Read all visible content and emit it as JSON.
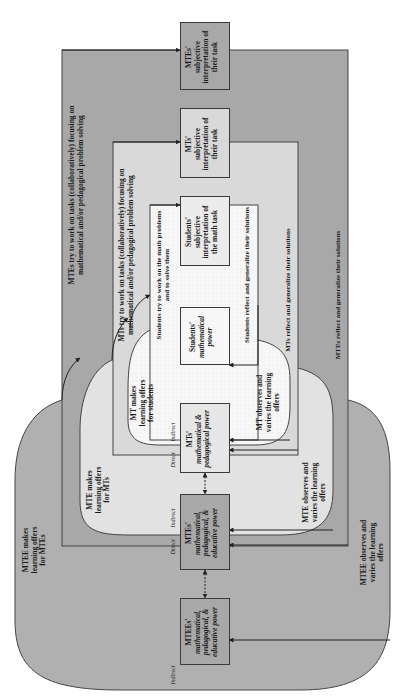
{
  "colors": {
    "outer_level": "#a8a8a8",
    "middle_level": "#d9d9d9",
    "inner_level": "#f5f5f5",
    "outer_blob": "#b0b0b0",
    "middle_blob": "#e2e2e2",
    "inner_blob": "#fafafa",
    "border": "#3a3a3a"
  },
  "orientation": "rotated 90 degrees counter-clockwise (text reads bottom-to-top)",
  "boxes": {
    "mtees_power": {
      "name": "MTEEs'",
      "desc": "mathematical, pedagogical, & educative power"
    },
    "mtes_power": {
      "name": "MTEs'",
      "desc": "mathematical, pedagogical, & educative power"
    },
    "mts_power": {
      "name": "MTs'",
      "desc": "mathematical & pedagogical power"
    },
    "students_power": {
      "name": "Students'",
      "desc": "mathematical power"
    },
    "students_subjective": {
      "line1": "Students'",
      "line2": "subjective",
      "line3": "interpretation of",
      "line4": "the math task"
    },
    "mts_subjective": {
      "line1": "MTs'",
      "line2": "subjective",
      "line3": "interpretation of",
      "line4": "their task"
    },
    "mtes_subjective": {
      "line1": "MTEs'",
      "line2": "subjective",
      "line3": "interpretation of",
      "line4": "their task"
    }
  },
  "flows": {
    "mtes_work_1": "MTEs try to work on tasks (collaboratively) focusing on",
    "mtes_work_2": "mathematical and/or pedagogical problem solving",
    "mts_work_1": "MTs try to work on tasks (collaboratively) focusing on",
    "mts_work_2": "mathematical and/or pedagogical problem solving",
    "students_work_1": "Students try to work on the math problems",
    "students_work_2": "and to solve them",
    "students_reflect": "Students reflect and generalize their solutions",
    "mts_reflect": "MTs reflect and generalize their solutions",
    "mtes_reflect": "MTEs reflect and generalize their solutions"
  },
  "offers": {
    "mtee_makes_1": "MTEE makes",
    "mtee_makes_2": "learning offers",
    "mtee_makes_3": "for MTEs",
    "mte_makes_1": "MTE makes",
    "mte_makes_2": "learning offers",
    "mte_makes_3": "for MTs",
    "mt_makes_1": "MT makes",
    "mt_makes_2": "learning offers",
    "mt_makes_3": "for students",
    "mtee_observes_1": "MTEE observes and",
    "mtee_observes_2": "varies the learning",
    "mtee_observes_3": "offers",
    "mte_observes_1": "MTE observes and",
    "mte_observes_2": "varies the learning",
    "mte_observes_3": "offers",
    "mt_observes_1": "MT observes and",
    "mt_observes_2": "varies the learning",
    "mt_observes_3": "offers"
  },
  "influence": {
    "indirect": "Indirect",
    "direct": "Direct"
  }
}
